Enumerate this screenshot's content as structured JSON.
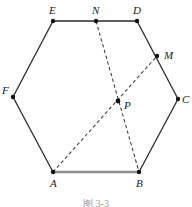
{
  "figure": {
    "shape_name": "hexagon",
    "caption": "图 3-3",
    "colors": {
      "edge": "#2b2b2b",
      "edge_highlight": "#8c8c8c",
      "dashed": "#3a3a3a",
      "vertex_dot": "#111111",
      "background": "#ffffff",
      "label": "#1a1a1a"
    },
    "points": [
      {
        "id": "A",
        "label": "A",
        "x": 53,
        "y": 172,
        "label_x": 50,
        "label_y": 178,
        "kind": "vertex"
      },
      {
        "id": "B",
        "label": "B",
        "x": 139,
        "y": 172,
        "label_x": 136,
        "label_y": 178,
        "kind": "vertex"
      },
      {
        "id": "C",
        "label": "C",
        "x": 178,
        "y": 99,
        "label_x": 182,
        "label_y": 94,
        "kind": "vertex"
      },
      {
        "id": "D",
        "label": "D",
        "x": 137,
        "y": 21,
        "label_x": 133,
        "label_y": 5,
        "kind": "vertex"
      },
      {
        "id": "E",
        "label": "E",
        "x": 53,
        "y": 21,
        "label_x": 49,
        "label_y": 5,
        "kind": "vertex"
      },
      {
        "id": "F",
        "label": "F",
        "x": 13,
        "y": 97,
        "label_x": 2,
        "label_y": 85,
        "kind": "vertex"
      },
      {
        "id": "M",
        "label": "M",
        "x": 157,
        "y": 56,
        "label_x": 164,
        "label_y": 50,
        "kind": "midpoint"
      },
      {
        "id": "N",
        "label": "N",
        "x": 96,
        "y": 21,
        "label_x": 92,
        "label_y": 5,
        "kind": "midpoint"
      },
      {
        "id": "P",
        "label": "P",
        "x": 118,
        "y": 101,
        "label_x": 124,
        "label_y": 100,
        "kind": "intersection"
      }
    ],
    "edges": [
      {
        "id": "AB",
        "from": "A",
        "to": "B",
        "style": "solid-thick-gray"
      },
      {
        "id": "BC",
        "from": "B",
        "to": "C",
        "style": "solid"
      },
      {
        "id": "CD",
        "from": "C",
        "to": "D",
        "style": "solid"
      },
      {
        "id": "DE",
        "from": "D",
        "to": "E",
        "style": "solid"
      },
      {
        "id": "EF",
        "from": "E",
        "to": "F",
        "style": "solid"
      },
      {
        "id": "FA",
        "from": "F",
        "to": "A",
        "style": "solid"
      }
    ],
    "dashed_segments": [
      {
        "id": "AM",
        "from": "A",
        "to": "M",
        "style": "dashed"
      },
      {
        "id": "NB",
        "from": "N",
        "to": "B",
        "style": "dashed"
      }
    ]
  }
}
